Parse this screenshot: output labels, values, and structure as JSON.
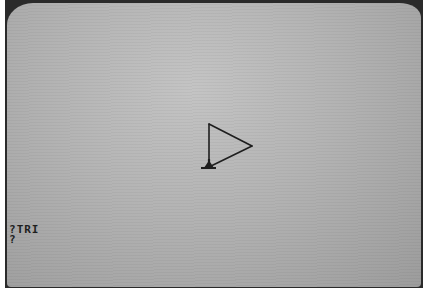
{
  "screen": {
    "description": "CRT monitor showing Logo turtle graphics",
    "background_color": "#b8b8b8",
    "ink_color": "#1e1e1e"
  },
  "drawing": {
    "shape": "triangle",
    "vertices": [
      [
        202,
        121
      ],
      [
        202,
        164
      ],
      [
        245,
        143
      ]
    ],
    "turtle": {
      "x": 202,
      "y": 164,
      "heading": "north"
    }
  },
  "console": {
    "lines": [
      {
        "prompt": "?",
        "command": "TRI"
      },
      {
        "prompt": "?",
        "command": ""
      }
    ]
  }
}
